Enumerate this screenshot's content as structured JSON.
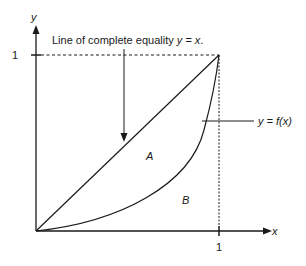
{
  "diagram": {
    "type": "lorenz-curve",
    "axes": {
      "x_label": "x",
      "y_label": "y",
      "x_tick": "1",
      "y_tick": "1"
    },
    "annotation": {
      "prefix": "Line of complete equality ",
      "equation": "y = x",
      "suffix": "."
    },
    "curve_label": "y = f(x)",
    "regions": {
      "a": "A",
      "b": "B"
    },
    "colors": {
      "line": "#1a1a1a",
      "background": "#ffffff"
    }
  }
}
